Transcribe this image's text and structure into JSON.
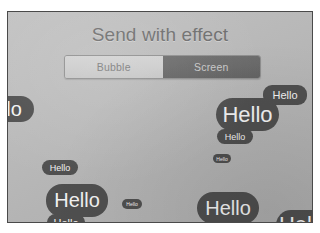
{
  "sheet": {
    "title": "Send with effect"
  },
  "segmented_control": {
    "name": "effect-type-selector",
    "selected": "Screen",
    "options": [
      {
        "label": "Bubble",
        "selected": false
      },
      {
        "label": "Screen",
        "selected": true
      }
    ]
  },
  "bubbles": [
    {
      "id": "edge-left",
      "text": "lo",
      "size": "lg"
    },
    {
      "id": "tr-small",
      "text": "Hello",
      "size": "md"
    },
    {
      "id": "tr-large",
      "text": "Hello",
      "size": "xl"
    },
    {
      "id": "tr-tiny",
      "text": "Hello",
      "size": "sm"
    },
    {
      "id": "mid-micro",
      "text": "Hello",
      "size": "xs"
    },
    {
      "id": "ml-small",
      "text": "Hello",
      "size": "sm"
    },
    {
      "id": "bl-large",
      "text": "Hello",
      "size": "lg"
    },
    {
      "id": "bl-small",
      "text": "Hello",
      "size": "md"
    },
    {
      "id": "bc-micro",
      "text": "Hello",
      "size": "xs"
    },
    {
      "id": "bc-tiny",
      "text": "Hello",
      "size": "md"
    },
    {
      "id": "br-large",
      "text": "Hello",
      "size": "lg"
    },
    {
      "id": "br-edge",
      "text": "Hello",
      "size": "xl"
    }
  ],
  "colors": {
    "bubble_fill": "#4f4f4f",
    "bubble_text": "#f2f2f2",
    "screen_background": "#b6b6b6",
    "title_text": "#6e6e6e",
    "segment_selected_bg": "#676767",
    "segment_unselected_bg": "#cccccc"
  }
}
